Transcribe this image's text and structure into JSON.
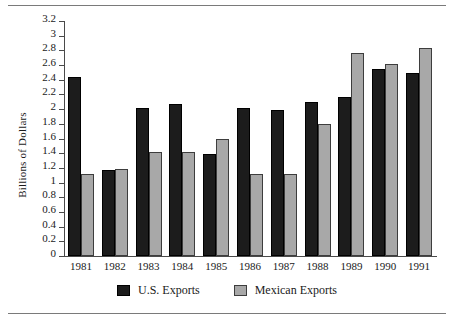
{
  "figure": {
    "has_top_rule": true,
    "has_bottom_rule": true
  },
  "chart_data": {
    "type": "bar",
    "title": "",
    "xlabel": "",
    "ylabel": "Billions of Dollars",
    "ylim": [
      0,
      3.2
    ],
    "ytick_step": 0.2,
    "grid": false,
    "legend_position": "bottom",
    "categories": [
      "1981",
      "1982",
      "1983",
      "1984",
      "1985",
      "1986",
      "1987",
      "1988",
      "1989",
      "1990",
      "1991"
    ],
    "yticks": [
      "3.2",
      "3",
      "2.8",
      "2.6",
      "2.4",
      "2.2",
      "2",
      "1.8",
      "1.6",
      "1.4",
      "1.2",
      "1",
      "0.8",
      "0.6",
      "0.4",
      "0.2",
      "0"
    ],
    "series": [
      {
        "name": "U.S. Exports",
        "color": "#1c1c1c",
        "values": [
          2.44,
          1.17,
          2.02,
          2.07,
          1.39,
          2.02,
          1.99,
          2.1,
          2.16,
          2.54,
          2.49
        ]
      },
      {
        "name": "Mexican Exports",
        "color": "#a8a8a8",
        "values": [
          1.12,
          1.18,
          1.41,
          1.41,
          1.59,
          1.12,
          1.11,
          1.8,
          2.77,
          2.62,
          2.83
        ]
      }
    ]
  },
  "legend": {
    "items": [
      {
        "label": "U.S. Exports",
        "swatch": "black-square-swatch"
      },
      {
        "label": "Mexican Exports",
        "swatch": "gray-square-swatch"
      }
    ]
  }
}
